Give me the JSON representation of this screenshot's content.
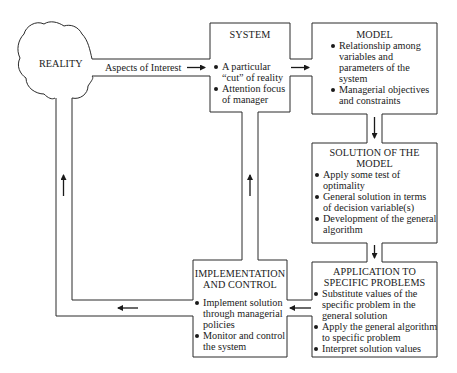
{
  "reality": {
    "label": "REALITY"
  },
  "connector": {
    "aspects_label": "Aspects of Interest"
  },
  "system": {
    "title": "SYSTEM",
    "bullets": [
      "A particular\n“cut” of reality",
      "Attention focus\nof manager"
    ],
    "b0l1": "A particular",
    "b0l2": "“cut” of reality",
    "b1l1": "Attention focus",
    "b1l2": "of manager"
  },
  "model": {
    "title": "MODEL",
    "b0l1": "Relationship among",
    "b0l2": "variables and",
    "b0l3": "parameters of the",
    "b0l4": "system",
    "b1l1": "Managerial objectives",
    "b1l2": "and constraints"
  },
  "solution": {
    "title_l1": "SOLUTION OF THE",
    "title_l2": "MODEL",
    "b0l1": "Apply some test of",
    "b0l2": "optimality",
    "b1l1": "General solution in terms",
    "b1l2": "of decision variable(s)",
    "b2l1": "Development of the general",
    "b2l2": "algorithm"
  },
  "application": {
    "title_l1": "APPLICATION TO",
    "title_l2": "SPECIFIC PROBLEMS",
    "b0l1": "Substitute values of the",
    "b0l2": "specific problem in the",
    "b0l3": "general solution",
    "b1l1": "Apply the general algorithm",
    "b1l2": "to specific problem",
    "b2l1": "Interpret solution values"
  },
  "implementation": {
    "title_l1": "IMPLEMENTATION",
    "title_l2": "AND CONTROL",
    "b0l1": "Implement solution",
    "b0l2": "through managerial",
    "b0l3": "policies",
    "b1l1": "Monitor and control",
    "b1l2": "the system"
  },
  "colors": {
    "line": "#2a2a2a",
    "background": "#ffffff",
    "text": "#1a1a1a"
  }
}
